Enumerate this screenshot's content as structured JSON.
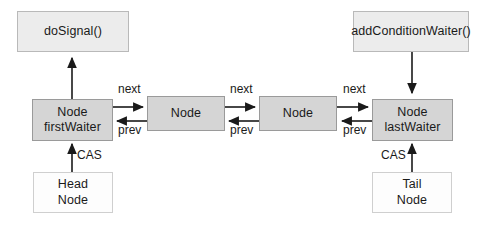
{
  "diagram": {
    "type": "linked-list-node-diagram",
    "canvas": {
      "width": 481,
      "height": 226,
      "background": "#ffffff"
    },
    "colors": {
      "node_fill": "#d5d5d5",
      "node_border": "#9a9a9a",
      "method_fill": "#ececec",
      "method_border": "#b9b9b9",
      "plain_fill": "#fdfdfd",
      "plain_border": "#cfcfcf",
      "arrow": "#1a1a1a",
      "text": "#1a1a1a"
    },
    "boxes": {
      "do_signal": {
        "label": "doSignal()"
      },
      "add_condition_waiter": {
        "label": "addConditionWaiter()"
      },
      "node_first_waiter": {
        "line1": "Node",
        "line2": "firstWaiter"
      },
      "node_middle_1": {
        "line1": "Node"
      },
      "node_middle_2": {
        "line1": "Node"
      },
      "node_last_waiter": {
        "line1": "Node",
        "line2": "lastWaiter"
      },
      "head_node": {
        "line1": "Head",
        "line2": "Node"
      },
      "tail_node": {
        "line1": "Tail",
        "line2": "Node"
      }
    },
    "edge_labels": {
      "next_1": "next",
      "prev_1": "prev",
      "next_2": "next",
      "prev_2": "prev",
      "next_3": "next",
      "prev_3": "prev",
      "cas_head": "CAS",
      "cas_tail": "CAS"
    }
  }
}
